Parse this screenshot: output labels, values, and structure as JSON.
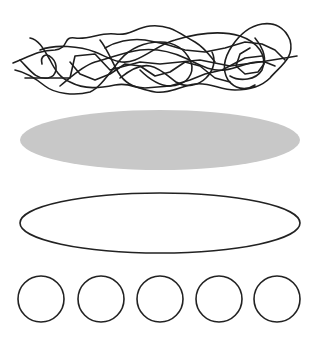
{
  "canvas": {
    "width": 317,
    "height": 344,
    "background": "#ffffff"
  },
  "colors": {
    "stroke": "#222222",
    "fill_gray": "#c8c8c8"
  },
  "shapes": {
    "scribble": {
      "label": "tangled scribble",
      "bounds": {
        "x": 13,
        "y": 18,
        "width": 284,
        "height": 78
      }
    },
    "filled_ellipse": {
      "cx": 160,
      "cy": 140,
      "rx": 140,
      "ry": 30,
      "fill": "#c8c8c8"
    },
    "outlined_ellipse": {
      "cx": 160,
      "cy": 223,
      "rx": 140,
      "ry": 30,
      "stroke": "#222222"
    },
    "circles": [
      {
        "cx": 41,
        "cy": 299,
        "r": 23
      },
      {
        "cx": 101,
        "cy": 299,
        "r": 23
      },
      {
        "cx": 160,
        "cy": 299,
        "r": 23
      },
      {
        "cx": 219,
        "cy": 299,
        "r": 23
      },
      {
        "cx": 277,
        "cy": 299,
        "r": 23
      }
    ]
  }
}
